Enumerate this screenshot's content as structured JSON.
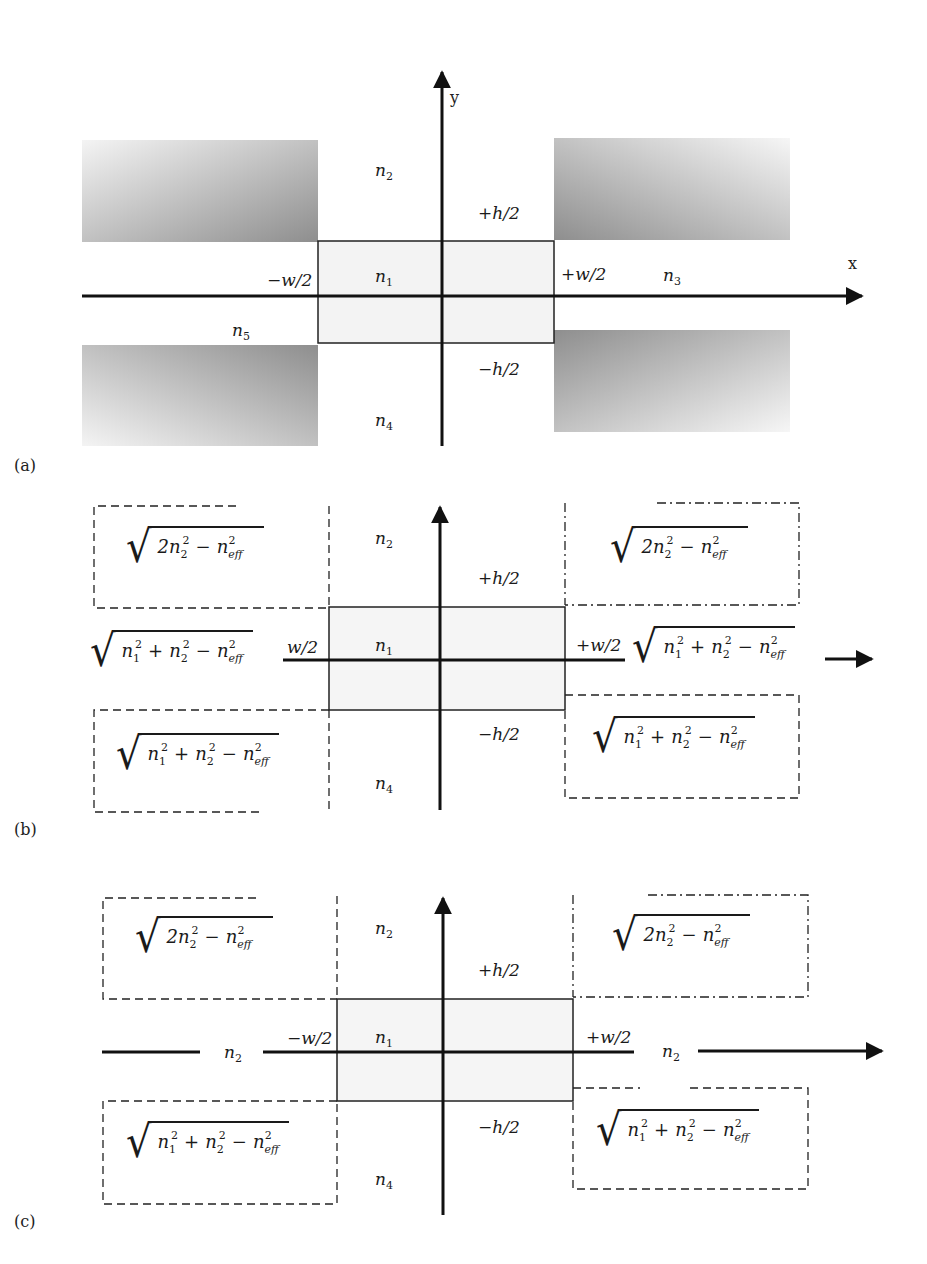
{
  "figure": {
    "panels": [
      {
        "tag": "(a)",
        "axis_x": "x",
        "axis_y": "y",
        "regions": {
          "core": "n1",
          "top": "n2",
          "right": "n3",
          "bottom": "n4",
          "left": "n5"
        },
        "bounds": {
          "left": "−w/2",
          "right": "+w/2",
          "top": "+h/2",
          "bottom": "−h/2"
        },
        "shaded_corners": 4
      },
      {
        "tag": "(b)",
        "regions": {
          "core": "n1",
          "top": "n2",
          "bottom": "n4",
          "left": "sqrt(n1^2 + n2^2 − n_eff^2)",
          "right": "sqrt(n1^2 + n2^2 − n_eff^2)",
          "top_left": "sqrt(2n2^2 − n_eff^2)",
          "top_right": "sqrt(2n2^2 − n_eff^2)",
          "bottom_left": "sqrt(n1^2 + n2^2 − n_eff^2)",
          "bottom_right": "sqrt(n1^2 + n2^2 − n_eff^2)"
        },
        "bounds": {
          "left": "w/2",
          "right": "+w/2",
          "top": "+h/2",
          "bottom": "−h/2"
        }
      },
      {
        "tag": "(c)",
        "regions": {
          "core": "n1",
          "top": "n2",
          "bottom": "n4",
          "left": "n2",
          "right": "n2",
          "top_left": "sqrt(2n2^2 − n_eff^2)",
          "top_right": "sqrt(2n2^2 − n_eff^2)",
          "bottom_left": "sqrt(n1^2 + n2^2 − n_eff^2)",
          "bottom_right": "sqrt(n1^2 + n2^2 − n_eff^2)"
        },
        "bounds": {
          "left": "−w/2",
          "right": "+w/2",
          "top": "+h/2",
          "bottom": "−h/2"
        }
      }
    ]
  },
  "labels": {
    "a_tag": "(a)",
    "b_tag": "(b)",
    "c_tag": "(c)",
    "x": "x",
    "y": "y",
    "n": "n",
    "s1": "1",
    "s2": "2",
    "s3": "3",
    "s4": "4",
    "s5": "5",
    "minus_w2": "−w/2",
    "plus_w2": "+w/2",
    "w2": "w/2",
    "plus_h2": "+h/2",
    "minus_h2": "−h/2",
    "two_n": "2n",
    "plus": "+",
    "minus": "−",
    "eff": "eff",
    "sq": "2",
    "radical": "√"
  }
}
